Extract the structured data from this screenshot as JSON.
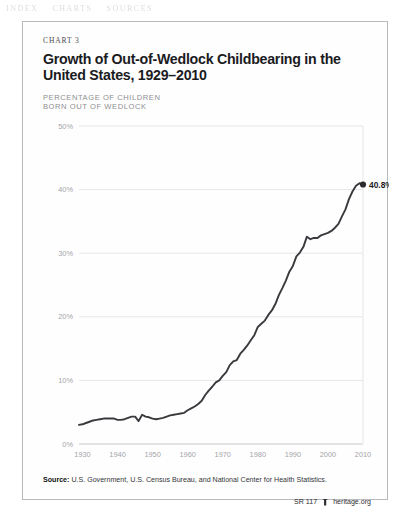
{
  "page": {
    "bleed_through": [
      "INDEX",
      "CHARTS",
      "SOURCES"
    ]
  },
  "chart": {
    "eyebrow": "CHART 3",
    "title": "Growth of Out-of-Wedlock Childbearing in the United States, 1929–2010",
    "axis_caption_line1": "PERCENTAGE OF CHILDREN",
    "axis_caption_line2": "BORN OUT OF WEDLOCK",
    "endpoint_label": "40.8%"
  },
  "footer": {
    "source_label": "Source:",
    "source_text": " U.S. Government, U.S. Census Bureau, and National Center for Health Statistics.",
    "report_id": "SR 117",
    "logo_icon": "heritage-shield-icon",
    "site": "heritage.org"
  },
  "colors": {
    "line": "#3a3a3e",
    "grid": "#e6e6e8",
    "tick_text": "#a4a4a9",
    "title": "#1b1b1f",
    "frame": "#b9b9be"
  },
  "chart_data": {
    "type": "line",
    "title": "Growth of Out-of-Wedlock Childbearing in the United States, 1929–2010",
    "xlabel": "",
    "ylabel": "PERCENTAGE OF CHILDREN BORN OUT OF WEDLOCK",
    "xlim": [
      1929,
      2010
    ],
    "ylim": [
      0,
      50
    ],
    "yticks": [
      0,
      10,
      20,
      30,
      40,
      50
    ],
    "ytick_labels": [
      "0%",
      "10%",
      "20%",
      "30%",
      "40%",
      "50%"
    ],
    "xticks": [
      1930,
      1940,
      1950,
      1960,
      1970,
      1980,
      1990,
      2000,
      2010
    ],
    "xtick_labels": [
      "1930",
      "1940",
      "1950",
      "1960",
      "1970",
      "1980",
      "1990",
      "2000",
      "2010"
    ],
    "grid": true,
    "legend": false,
    "annotations": [
      {
        "x": 2010,
        "y": 40.8,
        "text": "40.8%",
        "marker": "dot"
      }
    ],
    "series": [
      {
        "name": "Percentage of children born out of wedlock",
        "x": [
          1929,
          1930,
          1931,
          1932,
          1933,
          1934,
          1935,
          1936,
          1937,
          1938,
          1939,
          1940,
          1941,
          1942,
          1943,
          1944,
          1945,
          1946,
          1947,
          1948,
          1949,
          1950,
          1951,
          1952,
          1953,
          1954,
          1955,
          1956,
          1957,
          1958,
          1959,
          1960,
          1961,
          1962,
          1963,
          1964,
          1965,
          1966,
          1967,
          1968,
          1969,
          1970,
          1971,
          1972,
          1973,
          1974,
          1975,
          1976,
          1977,
          1978,
          1979,
          1980,
          1981,
          1982,
          1983,
          1984,
          1985,
          1986,
          1987,
          1988,
          1989,
          1990,
          1991,
          1992,
          1993,
          1994,
          1995,
          1996,
          1997,
          1998,
          1999,
          2000,
          2001,
          2002,
          2003,
          2004,
          2005,
          2006,
          2007,
          2008,
          2009,
          2010
        ],
        "values": [
          3.0,
          3.1,
          3.3,
          3.5,
          3.7,
          3.8,
          3.9,
          4.0,
          4.0,
          4.0,
          4.0,
          3.8,
          3.8,
          3.9,
          4.1,
          4.3,
          4.3,
          3.6,
          4.6,
          4.3,
          4.2,
          4.0,
          3.9,
          4.0,
          4.1,
          4.3,
          4.5,
          4.6,
          4.7,
          4.8,
          4.9,
          5.3,
          5.6,
          5.9,
          6.3,
          6.8,
          7.7,
          8.4,
          9.0,
          9.7,
          10.0,
          10.7,
          11.3,
          12.4,
          13.0,
          13.2,
          14.2,
          14.8,
          15.5,
          16.3,
          17.1,
          18.4,
          18.9,
          19.4,
          20.3,
          21.0,
          22.0,
          23.4,
          24.5,
          25.7,
          27.1,
          28.0,
          29.5,
          30.1,
          31.0,
          32.6,
          32.2,
          32.4,
          32.4,
          32.8,
          33.0,
          33.2,
          33.5,
          34.0,
          34.6,
          35.8,
          36.9,
          38.5,
          39.7,
          40.6,
          41.0,
          40.8
        ]
      }
    ]
  }
}
